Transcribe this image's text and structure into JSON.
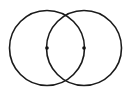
{
  "diagram": {
    "type": "vesica-piscis",
    "background": "#ffffff",
    "stroke_color": "#1a1a1a",
    "circles": [
      {
        "name": "left-circle",
        "cx": 47,
        "cy": 48,
        "r": 37.5
      },
      {
        "name": "right-circle",
        "cx": 84,
        "cy": 48,
        "r": 37.5
      }
    ],
    "points": [
      {
        "name": "left-center",
        "x": 47,
        "y": 48
      },
      {
        "name": "right-center",
        "x": 84,
        "y": 48
      }
    ]
  }
}
